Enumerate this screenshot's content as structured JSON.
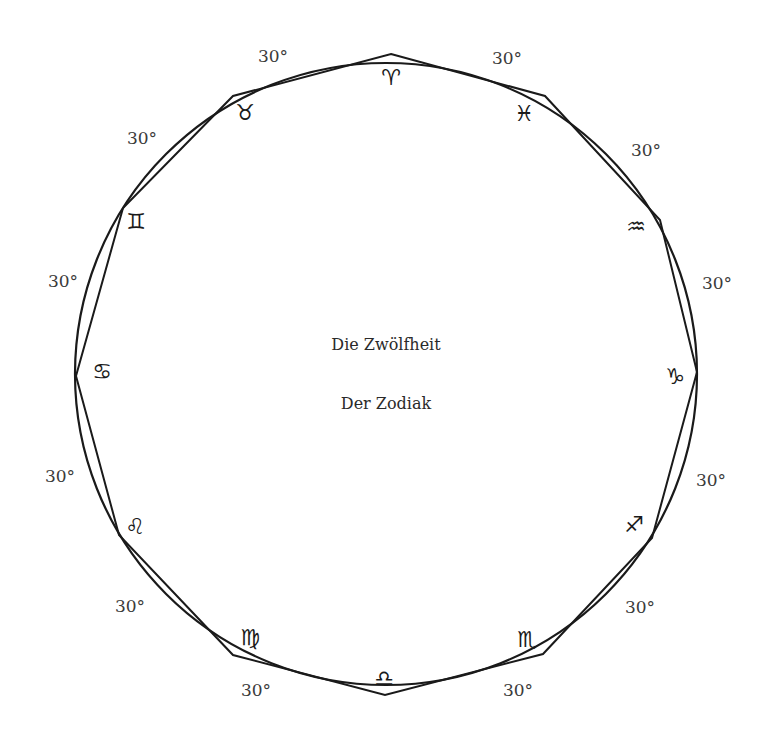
{
  "diagram": {
    "title_line1": "Die Zwölfheit",
    "title_line2": "Der Zodiak",
    "colors": {
      "stroke": "#1a1a1a",
      "text": "#3a3a3a",
      "background": "#ffffff"
    },
    "circle": {
      "cx": 386,
      "cy": 374,
      "r": 311
    },
    "signs": [
      {
        "name": "aries",
        "glyph": "♈",
        "vx": 391,
        "vy": 54,
        "gx": 391,
        "gy": 78
      },
      {
        "name": "pisces",
        "glyph": "♓",
        "vx": 545,
        "vy": 96,
        "gx": 524,
        "gy": 114
      },
      {
        "name": "aquarius",
        "glyph": "♒",
        "vx": 660,
        "vy": 220,
        "gx": 636,
        "gy": 227
      },
      {
        "name": "capricorn",
        "glyph": "♑",
        "vx": 697,
        "vy": 372,
        "gx": 675,
        "gy": 377
      },
      {
        "name": "sagittarius",
        "glyph": "♐",
        "vx": 652,
        "vy": 538,
        "gx": 634,
        "gy": 525
      },
      {
        "name": "scorpio",
        "glyph": "♏",
        "vx": 543,
        "vy": 654,
        "gx": 527,
        "gy": 640
      },
      {
        "name": "libra",
        "glyph": "♎",
        "vx": 385,
        "vy": 695,
        "gx": 384,
        "gy": 679
      },
      {
        "name": "virgo",
        "glyph": "♍",
        "vx": 233,
        "vy": 655,
        "gx": 250,
        "gy": 638
      },
      {
        "name": "leo",
        "glyph": "♌",
        "vx": 119,
        "vy": 535,
        "gx": 135,
        "gy": 527
      },
      {
        "name": "cancer",
        "glyph": "♋",
        "vx": 76,
        "vy": 376,
        "gx": 102,
        "gy": 372
      },
      {
        "name": "gemini",
        "glyph": "♊",
        "vx": 123,
        "vy": 208,
        "gx": 136,
        "gy": 222
      },
      {
        "name": "taurus",
        "glyph": "♉",
        "vx": 233,
        "vy": 96,
        "gx": 245,
        "gy": 113
      }
    ],
    "arc_labels": [
      {
        "text": "30°",
        "x": 273,
        "y": 56
      },
      {
        "text": "30°",
        "x": 507,
        "y": 58
      },
      {
        "text": "30°",
        "x": 646,
        "y": 150
      },
      {
        "text": "30°",
        "x": 717,
        "y": 283
      },
      {
        "text": "30°",
        "x": 711,
        "y": 480
      },
      {
        "text": "30°",
        "x": 640,
        "y": 607
      },
      {
        "text": "30°",
        "x": 518,
        "y": 690
      },
      {
        "text": "30°",
        "x": 256,
        "y": 690
      },
      {
        "text": "30°",
        "x": 130,
        "y": 606
      },
      {
        "text": "30°",
        "x": 60,
        "y": 476
      },
      {
        "text": "30°",
        "x": 63,
        "y": 281
      },
      {
        "text": "30°",
        "x": 142,
        "y": 138
      }
    ]
  }
}
